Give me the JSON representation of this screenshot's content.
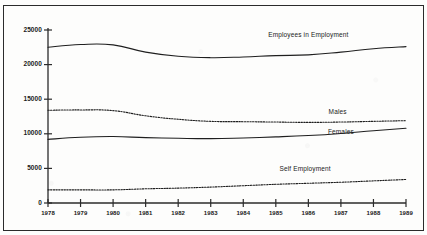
{
  "chart_data": {
    "type": "line",
    "title": "",
    "xlabel": "",
    "ylabel": "",
    "grid": false,
    "legend_position": "inline-right-annotations",
    "x": [
      1978,
      1979,
      1980,
      1981,
      1982,
      1983,
      1984,
      1985,
      1986,
      1987,
      1988,
      1989
    ],
    "xtick_labels": [
      "1978",
      "1979",
      "1980",
      "1981",
      "1982",
      "1983",
      "1984",
      "1985",
      "1986",
      "1987",
      "1988",
      "1989"
    ],
    "ytick_labels": [
      "0",
      "5000",
      "10000",
      "15000",
      "20000",
      "25000"
    ],
    "ytick_values": [
      0,
      5000,
      10000,
      15000,
      20000,
      25000
    ],
    "ylim": [
      0,
      25000
    ],
    "xlim": [
      1978,
      1989
    ],
    "series": [
      {
        "name": "Employees in Employment",
        "style": "solid",
        "label": "Employees in Employment",
        "values": [
          22500,
          22900,
          22850,
          21800,
          21200,
          21000,
          21100,
          21300,
          21400,
          21800,
          22300,
          22600
        ]
      },
      {
        "name": "Males",
        "style": "dotted",
        "label": "Males",
        "values": [
          13400,
          13450,
          13350,
          12600,
          12100,
          11800,
          11750,
          11700,
          11650,
          11700,
          11800,
          11900
        ]
      },
      {
        "name": "Females",
        "style": "solid",
        "label": "Females",
        "values": [
          9200,
          9500,
          9600,
          9450,
          9350,
          9300,
          9400,
          9550,
          9750,
          10050,
          10450,
          10800
        ]
      },
      {
        "name": "Self Employment",
        "style": "dotted",
        "label": "Self Employment",
        "values": [
          1900,
          1900,
          1900,
          2050,
          2150,
          2300,
          2500,
          2700,
          2850,
          3000,
          3200,
          3400
        ]
      }
    ],
    "annotations": [
      {
        "text": "Employees in Employment",
        "x": 1986.0,
        "y": 24100
      },
      {
        "text": "Males",
        "x": 1986.9,
        "y": 12950
      },
      {
        "text": "Females",
        "x": 1987.0,
        "y": 10050
      },
      {
        "text": "Self Employment",
        "x": 1985.9,
        "y": 4700
      }
    ]
  },
  "colors": {
    "line": "#1f1f1f",
    "axis": "#2b2b2b",
    "text": "#1a1a1a",
    "background": "#fdfdfc",
    "frame": "#2b2b2b"
  }
}
